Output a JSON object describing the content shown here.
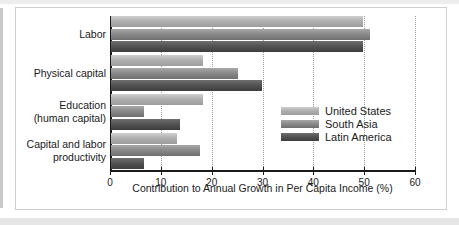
{
  "chart_data": {
    "type": "bar",
    "orientation": "horizontal",
    "title": "",
    "subtitle": "",
    "xlabel": "Contribution to Annual Growth in Per Capita Income (%)",
    "ylabel": "",
    "xlim": [
      0,
      60
    ],
    "xticks": [
      0,
      10,
      20,
      30,
      40,
      50,
      60
    ],
    "xticklabels": [
      "0",
      "10",
      "20",
      "30",
      "40",
      "50",
      "60"
    ],
    "grid": "vertical-dotted",
    "legend_position": "inside-right-middle",
    "categories": [
      "Labor",
      "Physical capital",
      "Education\n(human capital)",
      "Capital and labor\nproductivity"
    ],
    "category_lines": [
      [
        "Labor"
      ],
      [
        "Physical capital"
      ],
      [
        "Education",
        "(human capital)"
      ],
      [
        "Capital and labor",
        "productivity"
      ]
    ],
    "series": [
      {
        "name": "United States",
        "color": "#b0b0b0",
        "values": [
          49.5,
          18.0,
          18.0,
          13.0
        ]
      },
      {
        "name": "South Asia",
        "color": "#8a8a8a",
        "values": [
          51.0,
          25.0,
          6.5,
          17.5
        ]
      },
      {
        "name": "Latin America",
        "color": "#545454",
        "values": [
          49.5,
          29.8,
          13.5,
          6.5
        ]
      }
    ]
  },
  "legend": {
    "entries": [
      {
        "label": "United States"
      },
      {
        "label": "South Asia"
      },
      {
        "label": "Latin America"
      }
    ]
  },
  "axis": {
    "x_title": "Contribution to Annual Growth in Per Capita Income (%)",
    "x_tick_labels": [
      "0",
      "10",
      "20",
      "30",
      "40",
      "50",
      "60"
    ]
  }
}
